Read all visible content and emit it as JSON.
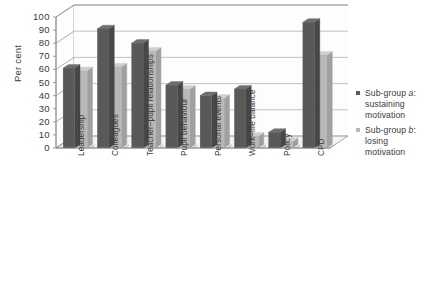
{
  "chart_data": {
    "type": "bar",
    "title": "",
    "xlabel": "",
    "ylabel": "Per cent",
    "ylim": [
      0,
      100
    ],
    "ytick_step": 10,
    "grid": true,
    "legend_position": "right",
    "style": "3d-clustered-column",
    "categories": [
      "Leadership",
      "Colleagues",
      "Teacher–pupil relationships",
      "Pupil behaviour",
      "Personal events",
      "Work–life balance",
      "Policy",
      "CPD"
    ],
    "yticks": [
      "0",
      "10",
      "20",
      "30",
      "40",
      "50",
      "60",
      "70",
      "80",
      "90",
      "100"
    ],
    "series": [
      {
        "name": "Sub-group a: sustaining motivation",
        "name_prefix": "Sub-group ",
        "name_italic": "a",
        "name_suffix": ": sustaining motivation",
        "color": "#595959",
        "values": [
          61,
          91,
          80,
          48,
          40,
          45,
          12,
          96
        ]
      },
      {
        "name": "Sub-group b: losing motivation",
        "name_prefix": "Sub-group ",
        "name_italic": "b",
        "name_suffix": ": losing motivation",
        "color": "#b8b8b8",
        "values": [
          59,
          62,
          74,
          45,
          38,
          9,
          5,
          71
        ]
      }
    ]
  },
  "legend": {
    "entries": [
      {
        "line1_prefix": "Sub-group ",
        "line1_italic": "a",
        "line1_suffix": ":",
        "line2": "sustaining",
        "line3": "motivation",
        "swatch_color": "#595959"
      },
      {
        "line1_prefix": "Sub-group ",
        "line1_italic": "b",
        "line1_suffix": ":",
        "line2": "losing",
        "line3": "motivation",
        "swatch_color": "#b8b8b8"
      }
    ]
  },
  "axis": {
    "y_title": "Per cent"
  },
  "colors": {
    "series_a": "#595959",
    "series_a_top": "#6e6e6e",
    "series_a_side": "#474747",
    "series_b": "#b8b8b8",
    "series_b_top": "#cfcfcf",
    "series_b_side": "#a0a0a0",
    "grid": "#a9a9a9",
    "axis": "#8a8a8a",
    "wall": "#fdfdfd",
    "floor": "#f4f4f4",
    "background": "#ffffff"
  }
}
